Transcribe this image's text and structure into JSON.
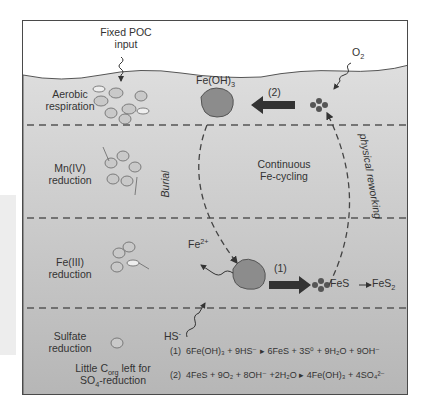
{
  "diagram": {
    "colors": {
      "frame": "#4a4a4a",
      "water": "#ffffff",
      "sediment_top": "#dcdcdc",
      "sediment_bottom": "#b8b8b8",
      "arrow": "#333333",
      "dash": "#555555"
    },
    "top_labels": {
      "poc_line1": "Fixed POC",
      "poc_line2": "input",
      "o2": "O",
      "o2_sub": "2"
    },
    "zones": [
      {
        "line1": "Aerobic",
        "line2": "respiration"
      },
      {
        "line1": "Mn(IV)",
        "line2": "reduction"
      },
      {
        "line1": "Fe(III)",
        "line2": "reduction"
      },
      {
        "line1": "Sulfate",
        "line2": "reduction"
      }
    ],
    "species": {
      "feoh3": "Fe(OH)",
      "feoh3_sub": "3",
      "fe2": "Fe",
      "fe2_sup": "2+",
      "hs": "HS",
      "hs_sup": "-",
      "fes_to_fes2_a": "FeS",
      "fes_to_fes2_b": "FeS",
      "fes_to_fes2_sub": "2"
    },
    "cycle_labels": {
      "center_line1": "Continuous",
      "center_line2": "Fe-cycling",
      "burial": "Burial",
      "reworking": "physical reworking"
    },
    "reaction_arrows": {
      "r1": "(1)",
      "r2": "(2)"
    },
    "note": {
      "line1a": "Little C",
      "line1_sub": "org",
      "line1b": " left for",
      "line2a": "SO",
      "line2_sub": "4",
      "line2b": "-reduction"
    },
    "equations": [
      {
        "num": "(1)",
        "text": "6Fe(OH)₃ + 9HS⁻ ▸ 6FeS + 3S⁰ + 9H₂O + 9OH⁻"
      },
      {
        "num": "(2)",
        "text": "4FeS + 9O₂ + 8OH⁻ +2H₂O ▸ 4Fe(OH)₃ + 4SO₄²⁻"
      }
    ]
  }
}
